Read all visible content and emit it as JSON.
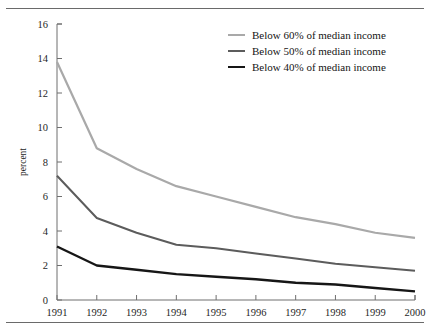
{
  "page": {
    "clipped_header_text": "",
    "top_rule": true,
    "bottom_rule": true
  },
  "chart_data": {
    "type": "line",
    "title": "",
    "xlabel": "",
    "ylabel": "percent",
    "x": [
      1991,
      1992,
      1993,
      1994,
      1995,
      1996,
      1997,
      1998,
      1999,
      2000
    ],
    "xtick_labels": [
      "1991",
      "1992",
      "1993",
      "1994",
      "1995",
      "1996",
      "1997",
      "1998",
      "1999",
      "2000"
    ],
    "ytick_labels": [
      "0",
      "2",
      "4",
      "6",
      "8",
      "10",
      "12",
      "14",
      "16"
    ],
    "yticks": [
      0,
      2,
      4,
      6,
      8,
      10,
      12,
      14,
      16
    ],
    "ylim": [
      0,
      16
    ],
    "grid": false,
    "legend_position": "top-right",
    "series": [
      {
        "name": "Below 60% of median income",
        "color": "#a9a9a9",
        "width": 2.2,
        "values": [
          13.8,
          8.8,
          7.6,
          6.6,
          6.0,
          5.4,
          4.8,
          4.4,
          3.9,
          3.6
        ]
      },
      {
        "name": "Below 50% of median income",
        "color": "#5c5c5c",
        "width": 2.0,
        "values": [
          7.2,
          4.75,
          3.9,
          3.2,
          3.0,
          2.7,
          2.4,
          2.1,
          1.9,
          1.7
        ]
      },
      {
        "name": "Below 40% of median income",
        "color": "#161616",
        "width": 2.4,
        "values": [
          3.1,
          2.0,
          1.75,
          1.5,
          1.35,
          1.2,
          1.0,
          0.9,
          0.7,
          0.5
        ]
      }
    ]
  }
}
